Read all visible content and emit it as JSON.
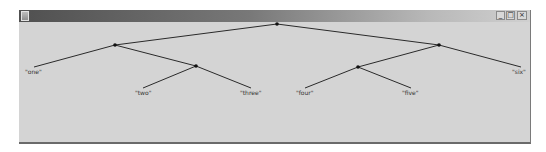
{
  "window": {
    "title": "",
    "buttons": {
      "minimize": "_",
      "maximize": "□",
      "close": "×"
    }
  },
  "tree": {
    "nodes": [
      {
        "id": "root",
        "x": 258,
        "y": 2
      },
      {
        "id": "n1",
        "x": 96,
        "y": 23
      },
      {
        "id": "n2",
        "x": 177,
        "y": 44
      },
      {
        "id": "n3",
        "x": 420,
        "y": 23
      },
      {
        "id": "n4",
        "x": 339,
        "y": 45
      }
    ],
    "leaves": [
      {
        "label": "\"one\"",
        "x": 15,
        "y": 45,
        "lx": 6,
        "ly": 46
      },
      {
        "label": "\"two\"",
        "x": 124,
        "y": 66,
        "lx": 116,
        "ly": 67
      },
      {
        "label": "\"three\"",
        "x": 232,
        "y": 66,
        "lx": 221,
        "ly": 67
      },
      {
        "label": "\"four\"",
        "x": 286,
        "y": 66,
        "lx": 277,
        "ly": 67
      },
      {
        "label": "\"five\"",
        "x": 392,
        "y": 66,
        "lx": 383,
        "ly": 67
      },
      {
        "label": "\"six\"",
        "x": 502,
        "y": 45,
        "lx": 493,
        "ly": 46
      }
    ],
    "edges": [
      [
        "root",
        "n1"
      ],
      [
        "root",
        "n3"
      ],
      [
        "n1",
        "leaf0"
      ],
      [
        "n1",
        "n2"
      ],
      [
        "n2",
        "leaf1"
      ],
      [
        "n2",
        "leaf2"
      ],
      [
        "n3",
        "n4"
      ],
      [
        "n3",
        "leaf5"
      ],
      [
        "n4",
        "leaf3"
      ],
      [
        "n4",
        "leaf4"
      ]
    ]
  }
}
